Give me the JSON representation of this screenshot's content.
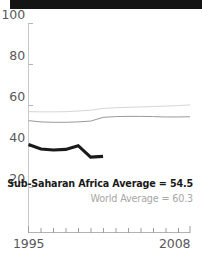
{
  "figure": {
    "title_bar_text": ""
  },
  "annotations": {
    "ssa": "Sub-Saharan Africa Average = 54.5",
    "world": "World Average = 60.3"
  },
  "axis": {
    "y_ticks": [
      "20",
      "40",
      "60",
      "80",
      "100"
    ],
    "x_start": "1995",
    "x_end": "2008"
  },
  "chart_data": {
    "type": "line",
    "title": "",
    "xlabel": "",
    "ylabel": "",
    "xlim": [
      1995,
      2008
    ],
    "ylim": [
      0,
      100
    ],
    "yticks": [
      20,
      40,
      60,
      80,
      100
    ],
    "xticks": [
      1995,
      1996,
      1997,
      1998,
      1999,
      2000,
      2001,
      2002,
      2003,
      2004,
      2005,
      2006,
      2007,
      2008
    ],
    "xtick_labels_shown": [
      "1995",
      "2008"
    ],
    "grid": false,
    "legend_position": "inside-bottom-right",
    "series": [
      {
        "name": "World Average",
        "color": "#d6d6d6",
        "line_width": 1,
        "average_label": "World Average = 60.3",
        "average": 60.3,
        "x": [
          1995,
          1996,
          1997,
          1998,
          1999,
          2000,
          2001,
          2002,
          2003,
          2004,
          2005,
          2006,
          2007,
          2008
        ],
        "values": [
          57.0,
          56.9,
          56.9,
          57.0,
          57.3,
          57.7,
          58.6,
          58.9,
          59.1,
          59.3,
          59.5,
          59.7,
          59.9,
          60.3
        ]
      },
      {
        "name": "Developing Country Average",
        "color": "#9a9a9a",
        "line_width": 1,
        "x": [
          1995,
          1996,
          1997,
          1998,
          1999,
          2000,
          2001,
          2002,
          2003,
          2004,
          2005,
          2006,
          2007,
          2008
        ],
        "values": [
          52.6,
          52.0,
          51.8,
          51.8,
          52.0,
          52.4,
          54.2,
          54.6,
          54.7,
          54.7,
          54.6,
          54.4,
          54.4,
          54.5
        ]
      },
      {
        "name": "Sub-Saharan Africa Average",
        "color": "#1a1a1a",
        "line_width": 3,
        "average_label": "Sub-Saharan Africa Average = 54.5",
        "average": 54.5,
        "x": [
          1995,
          1996,
          1997,
          1998,
          1999,
          2000,
          2001
        ],
        "values": [
          41.0,
          38.8,
          38.3,
          38.6,
          40.4,
          34.8,
          35.2
        ]
      }
    ]
  }
}
